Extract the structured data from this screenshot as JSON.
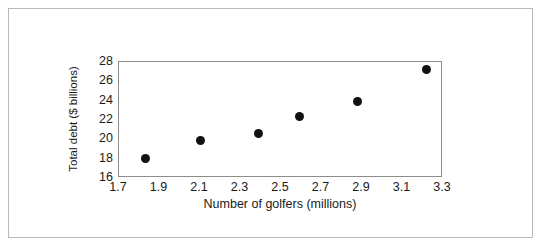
{
  "chart_data": {
    "type": "scatter",
    "title": "",
    "xlabel": "Number of golfers (millions)",
    "ylabel": "Total debt ($ billions)",
    "xlim": [
      1.7,
      3.3
    ],
    "ylim": [
      16,
      28
    ],
    "xticks": [
      "1.7",
      "1.9",
      "2.1",
      "2.3",
      "2.5",
      "2.7",
      "2.9",
      "3.1",
      "3.3"
    ],
    "yticks": [
      "16",
      "18",
      "20",
      "22",
      "24",
      "26",
      "28"
    ],
    "grid": false,
    "legend": false,
    "marker_color": "#111111",
    "points": [
      {
        "x": 1.83,
        "y": 18.0
      },
      {
        "x": 2.1,
        "y": 19.9
      },
      {
        "x": 2.39,
        "y": 20.6
      },
      {
        "x": 2.59,
        "y": 22.4
      },
      {
        "x": 2.88,
        "y": 23.9
      },
      {
        "x": 3.22,
        "y": 27.2
      }
    ]
  }
}
